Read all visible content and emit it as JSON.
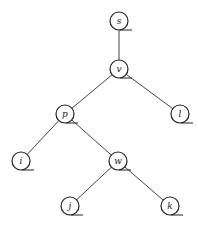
{
  "diagram": {
    "type": "tree",
    "nodes": [
      {
        "id": "s",
        "label": "s",
        "x": 119,
        "y": 21
      },
      {
        "id": "v",
        "label": "v",
        "x": 119,
        "y": 69
      },
      {
        "id": "p",
        "label": "p",
        "x": 65,
        "y": 114
      },
      {
        "id": "l",
        "label": "l",
        "x": 180,
        "y": 114
      },
      {
        "id": "i",
        "label": "i",
        "x": 21,
        "y": 161
      },
      {
        "id": "w",
        "label": "w",
        "x": 118,
        "y": 161
      },
      {
        "id": "j",
        "label": "j",
        "x": 70,
        "y": 206
      },
      {
        "id": "k",
        "label": "k",
        "x": 170,
        "y": 206
      }
    ],
    "edges": [
      [
        "s",
        "v"
      ],
      [
        "v",
        "p"
      ],
      [
        "v",
        "l"
      ],
      [
        "p",
        "i"
      ],
      [
        "p",
        "w"
      ],
      [
        "w",
        "j"
      ],
      [
        "w",
        "k"
      ]
    ],
    "node_radius": 9
  },
  "caption": ""
}
